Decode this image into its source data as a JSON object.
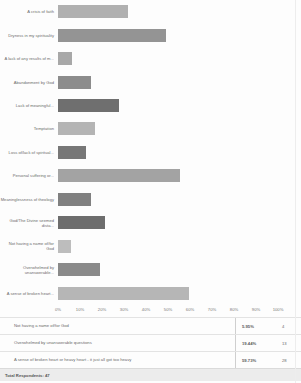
{
  "chart_data": {
    "type": "bar",
    "orientation": "horizontal",
    "title": "",
    "xlabel": "",
    "ylabel": "",
    "xlim": [
      0,
      100
    ],
    "grid": false,
    "legend": null,
    "tick_labels": [
      "0%",
      "10%",
      "20%",
      "30%",
      "40%",
      "50%",
      "60%",
      "70%",
      "80%",
      "90%",
      "100%"
    ],
    "tick_values": [
      0,
      10,
      20,
      30,
      40,
      50,
      60,
      70,
      80,
      90,
      100
    ],
    "categories": [
      "A crisis of faith",
      "Dryness in my spirituality",
      "A lack of any results of m...",
      "Abandonment by God",
      "Lack of meaningful...",
      "Temptation",
      "Loss of/lack of spiritual...",
      "Personal suffering or...",
      "Meaninglessness of theology",
      "God/The Divine seemed dista...",
      "Not having a name of/for God",
      "Overwhelmed by unanswerable...",
      "A sense of broken heart..."
    ],
    "values": [
      31.9,
      48.9,
      6.4,
      14.9,
      27.7,
      17.0,
      12.8,
      55.3,
      14.9,
      21.3,
      5.9,
      19.1,
      59.75
    ],
    "bar_colors": [
      "#b0b0b0",
      "#949494",
      "#a8a8a8",
      "#8c8c8c",
      "#6f6f6f",
      "#b4b4b4",
      "#777777",
      "#a3a3a3",
      "#808080",
      "#6d6d6d",
      "#bdbdbd",
      "#8a8a8a",
      "#b6b6b6"
    ]
  },
  "table": {
    "rows": [
      {
        "label": "Not having a name of/for God",
        "percent": "5.95%",
        "count": "4"
      },
      {
        "label": "Overwhelmed by unanswerable questions",
        "percent": "19.44%",
        "count": "13"
      },
      {
        "label": "A sense of broken heart or heavy heart - it just all got too heavy",
        "percent": "59.73%",
        "count": "28"
      }
    ],
    "total_label": "Total Respondents: 47"
  }
}
